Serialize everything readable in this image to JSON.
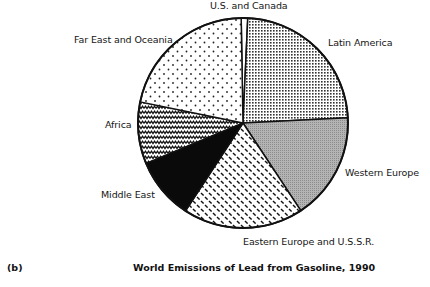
{
  "figure_label": "(b)",
  "chart_data": {
    "type": "pie",
    "title": "World Emissions of Lead from Gasoline, 1990",
    "unit": "percent of world total (estimated from slice angles)",
    "start_angle_deg": -1,
    "direction": "clockwise",
    "slices": [
      {
        "label": "U.S. and Canada",
        "value": 1.0,
        "pattern": "white"
      },
      {
        "label": "Latin America",
        "value": 23.5,
        "pattern": "dense-dots"
      },
      {
        "label": "Western Europe",
        "value": 16.5,
        "pattern": "gray"
      },
      {
        "label": "Eastern Europe and U.S.S.R.",
        "value": 18.5,
        "pattern": "diagonal-dashes"
      },
      {
        "label": "Middle East",
        "value": 9.5,
        "pattern": "black"
      },
      {
        "label": "Africa",
        "value": 9.5,
        "pattern": "zigzag"
      },
      {
        "label": "Far East and Oceania",
        "value": 21.5,
        "pattern": "sparse-dots"
      }
    ],
    "legend": "none (direct labels)",
    "grid": false
  },
  "labels": {
    "us_canada": "U.S. and Canada",
    "latin_america": "Latin America",
    "western_europe": "Western Europe",
    "eastern_europe": "Eastern Europe and U.S.S.R.",
    "middle_east": "Middle East",
    "africa": "Africa",
    "far_east": "Far East and Oceania"
  },
  "colors": {
    "outline": "#111111",
    "gray_fill": "#a8a8a8",
    "black_fill": "#0a0a0a",
    "background": "#ffffff"
  }
}
